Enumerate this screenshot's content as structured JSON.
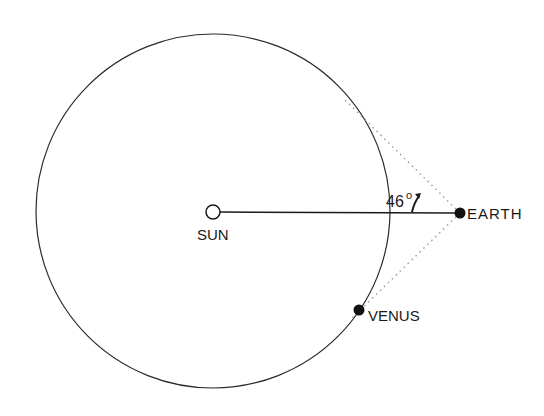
{
  "diagram": {
    "title": "",
    "colors": {
      "ink": "#1a1a1a",
      "background": "#ffffff",
      "dotted": "#9a9a9a"
    },
    "orbit": {
      "name": "Venus orbit",
      "cx": 213,
      "cy": 211,
      "r": 177
    },
    "bodies": [
      {
        "name": "SUN",
        "label": "SUN",
        "x": 213,
        "y": 212,
        "r": 7,
        "fill": "open"
      },
      {
        "name": "EARTH",
        "label": "EARTH",
        "x": 460,
        "y": 213,
        "r": 5.5,
        "fill": "solid"
      },
      {
        "name": "VENUS",
        "label": "VENUS",
        "x": 359,
        "y": 310,
        "r": 5.5,
        "fill": "solid"
      }
    ],
    "lines": [
      {
        "name": "sun-earth-line",
        "from": "SUN",
        "to": "EARTH",
        "style": "solid"
      },
      {
        "name": "earth-upper-tangent",
        "style": "dotted"
      },
      {
        "name": "earth-venus-tangent",
        "style": "dotted"
      }
    ],
    "angle": {
      "label": "46",
      "degree_symbol": "o",
      "value_degrees": 46
    }
  }
}
